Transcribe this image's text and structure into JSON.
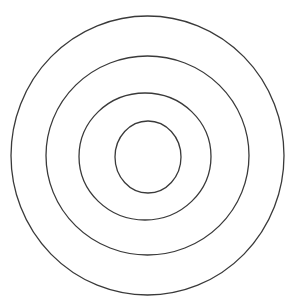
{
  "page": {
    "background_color": "#ffffff",
    "width": 292,
    "height": 306
  },
  "diagram": {
    "type": "concentric-circles",
    "name": "bullseye-target",
    "stroke_color": "#3a3a3a",
    "stroke_width": 1.3,
    "fill": "none",
    "ring_count": 4,
    "center": {
      "x": 147.5,
      "y": 156.0
    },
    "rings": [
      {
        "index": 1,
        "label": "outer-ring",
        "cx": 147.5,
        "cy": 155.5,
        "rx": 136.5,
        "ry": 139.5,
        "bounds": {
          "left": 11,
          "right": 284,
          "top": 16,
          "bottom": 295
        }
      },
      {
        "index": 2,
        "label": "second-ring",
        "cx": 147.5,
        "cy": 155.5,
        "rx": 101.5,
        "ry": 99.5,
        "bounds": {
          "left": 46,
          "right": 249,
          "top": 56,
          "bottom": 255
        }
      },
      {
        "index": 3,
        "label": "third-ring",
        "cx": 145.0,
        "cy": 156.5,
        "rx": 66.0,
        "ry": 63.5,
        "bounds": {
          "left": 79,
          "right": 211,
          "top": 93,
          "bottom": 220
        }
      },
      {
        "index": 4,
        "label": "inner-circle",
        "cx": 148.0,
        "cy": 157.0,
        "rx": 33.0,
        "ry": 36.0,
        "bounds": {
          "left": 115,
          "right": 181,
          "top": 121,
          "bottom": 193
        }
      }
    ]
  }
}
